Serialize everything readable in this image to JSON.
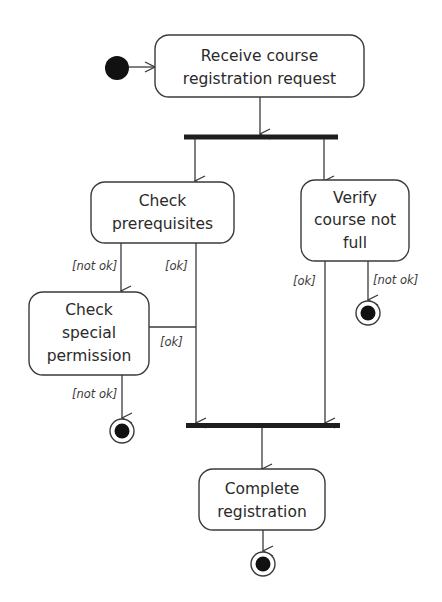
{
  "diagram": {
    "type": "UML activity diagram",
    "nodes": {
      "start": {
        "label": "initial-node"
      },
      "receive": {
        "lines": [
          "Receive course",
          "registration request"
        ]
      },
      "check_prereq": {
        "lines": [
          "Check",
          "prerequisites"
        ]
      },
      "verify_full": {
        "lines": [
          "Verify",
          "course not",
          "full"
        ]
      },
      "check_special": {
        "lines": [
          "Check",
          "special",
          "permission"
        ]
      },
      "complete": {
        "lines": [
          "Complete",
          "registration"
        ]
      }
    },
    "guards": {
      "prereq_not_ok": "[not ok]",
      "prereq_ok": "[ok]",
      "special_ok": "[ok]",
      "special_not_ok": "[not ok]",
      "verify_ok": "[ok]",
      "verify_not_ok": "[not ok]"
    },
    "colors": {
      "stroke": "#3a3a3a",
      "fill": "#ffffff",
      "bar": "#1e1e1e",
      "text": "#2a2a2a"
    }
  }
}
